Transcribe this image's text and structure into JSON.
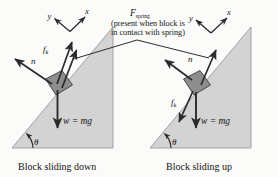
{
  "figure": {
    "background_color": "#fbfbfa",
    "incline_fill": "#d3d3d3",
    "incline_stroke": "#8f8f8f",
    "block_fill": "#8d8d8d",
    "block_stroke": "#3a3a3a",
    "arrow_color": "#2b2b2b"
  },
  "annotation": {
    "force_label": "F",
    "force_subscript": "spring",
    "note_line_1": "(present when block is",
    "note_line_2": "in contact with spring)"
  },
  "panels": [
    {
      "id": "left",
      "caption": "Block sliding down",
      "axes": {
        "x_label": "x",
        "y_label": "y"
      },
      "angle_label": "θ",
      "weight_label": "w = mg",
      "forces": [
        {
          "name": "normal-force",
          "label": "n",
          "direction": "up-left"
        },
        {
          "name": "kinetic-friction-force",
          "label": "f",
          "subscript": "k",
          "direction": "up-incline"
        },
        {
          "name": "spring-force",
          "label": "",
          "direction": "up-incline"
        },
        {
          "name": "weight-force",
          "label": "w = mg",
          "direction": "down"
        }
      ]
    },
    {
      "id": "right",
      "caption": "Block sliding up",
      "axes": {
        "x_label": "x",
        "y_label": "y"
      },
      "angle_label": "θ",
      "weight_label": "w = mg",
      "forces": [
        {
          "name": "normal-force",
          "label": "n",
          "direction": "up-left"
        },
        {
          "name": "kinetic-friction-force",
          "label": "f",
          "subscript": "k",
          "direction": "down-incline"
        },
        {
          "name": "spring-force",
          "label": "",
          "direction": "up-incline"
        },
        {
          "name": "weight-force",
          "label": "w = mg",
          "direction": "down"
        }
      ]
    }
  ]
}
